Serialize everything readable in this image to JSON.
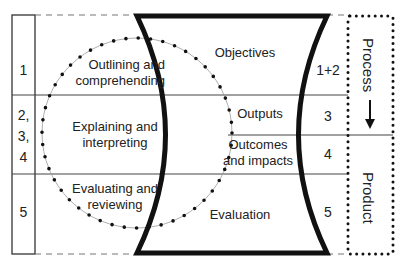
{
  "diagram": {
    "left_column": {
      "rows": [
        {
          "number": "1",
          "activity": "Outlining and comprehending",
          "activity_line1": "Outlining and",
          "activity_line2": "comprehending"
        },
        {
          "number": "2,\n3,\n4",
          "number_lines": [
            "2,",
            "3,",
            "4"
          ],
          "activity": "Explaining and interpreting",
          "activity_line1": "Explaining and",
          "activity_line2": "interpreting"
        },
        {
          "number": "5",
          "activity": "Evaluating and reviewing",
          "activity_line1": "Evaluating and",
          "activity_line2": "reviewing"
        }
      ]
    },
    "hourglass": {
      "sections": [
        {
          "label": "Objectives",
          "number": "1+2"
        },
        {
          "label": "Outputs",
          "number": "3"
        },
        {
          "label": "Outcomes and impacts",
          "label_line1": "Outcomes",
          "label_line2": "and impacts",
          "number": "4"
        },
        {
          "label": "Evaluation",
          "number": "5"
        }
      ]
    },
    "right_box": {
      "process_label": "Process",
      "product_label": "Product",
      "arrow": "down-arrow-icon"
    },
    "colors": {
      "line": "#222222",
      "thin_line": "#444444",
      "circle": "#888888",
      "background": "#ffffff"
    }
  }
}
